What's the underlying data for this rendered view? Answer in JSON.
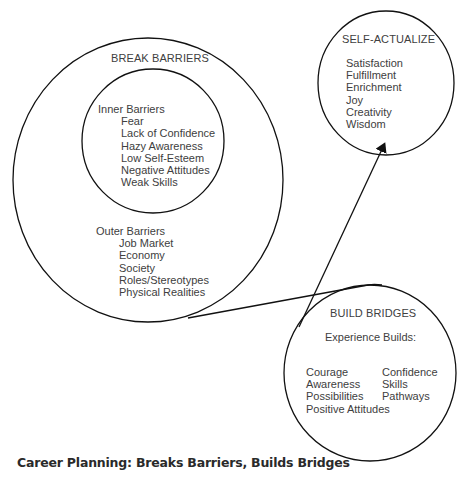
{
  "diagram": {
    "break_barriers": {
      "title": "BREAK BARRIERS",
      "inner": {
        "heading": "Inner Barriers",
        "items": [
          "Fear",
          "Lack of Confidence",
          "Hazy Awareness",
          "Low Self-Esteem",
          "Negative Attitudes",
          "Weak Skills"
        ]
      },
      "outer": {
        "heading": "Outer Barriers",
        "items": [
          "Job Market",
          "Economy",
          "Society",
          "Roles/Stereotypes",
          "Physical Realities"
        ]
      }
    },
    "self_actualize": {
      "title": "SELF-ACTUALIZE",
      "items": [
        "Satisfaction",
        "Fulfillment",
        "Enrichment",
        "Joy",
        "Creativity",
        "Wisdom"
      ]
    },
    "build_bridges": {
      "title": "BUILD BRIDGES",
      "subtitle": "Experience Builds:",
      "col1": [
        "Courage",
        "Awareness",
        "Possibilities",
        "Positive Attitudes"
      ],
      "col2": [
        "Confidence",
        "Skills",
        "Pathways"
      ]
    },
    "connectors": [
      {
        "from": "break_barriers",
        "to": "build_bridges",
        "type": "line"
      },
      {
        "from": "build_bridges",
        "to": "self_actualize",
        "type": "arrow"
      }
    ]
  },
  "caption": "Career Planning: Breaks Barriers, Builds Bridges"
}
